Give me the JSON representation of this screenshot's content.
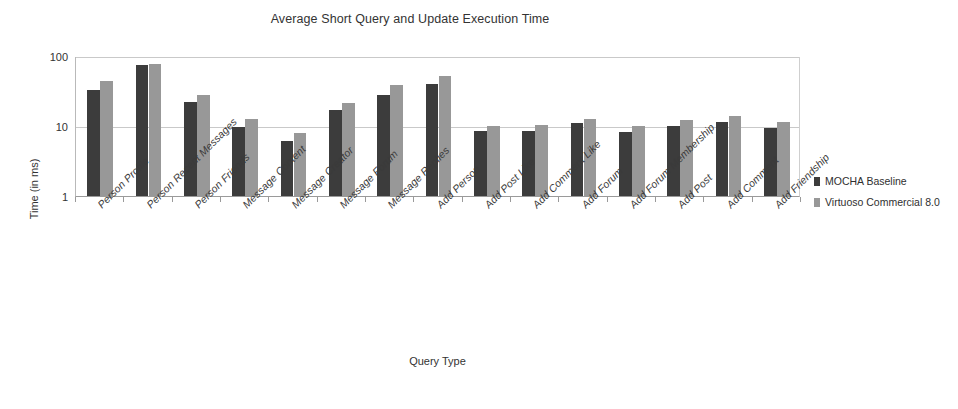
{
  "chart_data": {
    "type": "bar",
    "title": "Average Short Query and Update Execution Time",
    "xlabel": "Query Type",
    "ylabel": "Time (in ms)",
    "yscale": "log",
    "ylim": [
      1,
      100
    ],
    "ytick_labels": [
      "100",
      "10",
      "1"
    ],
    "ytick_values": [
      100,
      10,
      1
    ],
    "grid": true,
    "legend_position": "right",
    "categories": [
      "Person Profile",
      "Person Recent Messages",
      "Person Friends",
      "Message Content",
      "Message Creator",
      "Message Forum",
      "Message Replies",
      "Add Person",
      "Add Post Like",
      "Add Comment Like",
      "Add Forum",
      "Add Forum Membership",
      "Add Post",
      "Add Comment",
      "Add Friendship"
    ],
    "series": [
      {
        "name": "MOCHA Baseline",
        "color": "#3c3c3c",
        "values": [
          33,
          75,
          22,
          9.8,
          6.2,
          17,
          28,
          40,
          8.5,
          8.6,
          11,
          8.2,
          10,
          11.5,
          9.5
        ]
      },
      {
        "name": "Virtuoso Commercial 8.0",
        "color": "#989898",
        "values": [
          44,
          78,
          28,
          12.5,
          8.0,
          21,
          39,
          52,
          10.0,
          10.5,
          12.5,
          10.0,
          12.0,
          14.0,
          11.5
        ]
      }
    ]
  }
}
